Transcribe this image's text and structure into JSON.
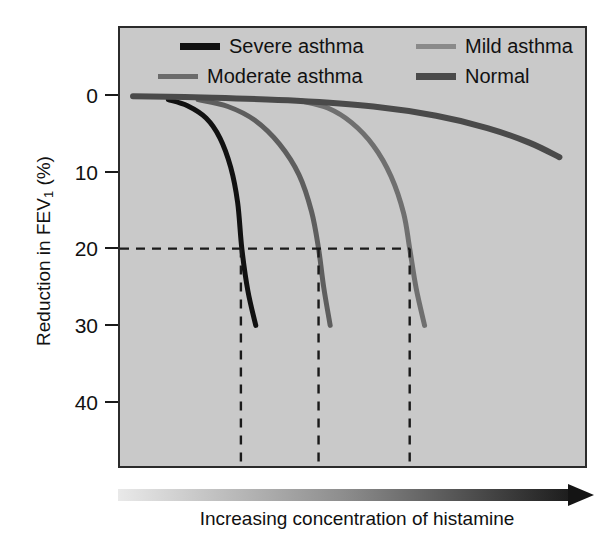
{
  "chart_data": {
    "type": "line",
    "title": "",
    "xlabel": "Increasing concentration of histamine",
    "ylabel": "Reduction in FEV1 (%)",
    "ylabel_main": "Reduction in FEV",
    "ylabel_sub": "1",
    "ylabel_unit": " (%)",
    "x_axis": {
      "label": "Increasing concentration of histamine",
      "type": "arrow-gradient",
      "direction": "increasing-right",
      "ticks": [],
      "tick_labels": []
    },
    "y_axis": {
      "label": "Reduction in FEV1 (%)",
      "ticks": [
        0,
        10,
        20,
        30,
        40
      ],
      "tick_labels": [
        "0",
        "10",
        "20",
        "30",
        "40"
      ],
      "ylim": [
        0,
        46
      ],
      "direction": "inverted-downward"
    },
    "grid": false,
    "legend_position": "top-inside",
    "series": [
      {
        "name": "Severe asthma",
        "color": "#111111",
        "width": 5,
        "pc20_x": 0.26,
        "points": [
          [
            0.104,
            0.6
          ],
          [
            0.145,
            1.4
          ],
          [
            0.185,
            3.0
          ],
          [
            0.215,
            5.6
          ],
          [
            0.238,
            9.4
          ],
          [
            0.253,
            14.0
          ],
          [
            0.262,
            20.0
          ],
          [
            0.275,
            25.5
          ],
          [
            0.292,
            30.0
          ]
        ],
        "end_reduction": 30
      },
      {
        "name": "Moderate asthma",
        "color": "#5e5e5e",
        "width": 5,
        "pc20_x": 0.427,
        "points": [
          [
            0.168,
            0.6
          ],
          [
            0.232,
            1.5
          ],
          [
            0.29,
            3.3
          ],
          [
            0.343,
            6.4
          ],
          [
            0.385,
            10.4
          ],
          [
            0.412,
            15.2
          ],
          [
            0.427,
            20.0
          ],
          [
            0.438,
            25.0
          ],
          [
            0.452,
            30.0
          ]
        ],
        "end_reduction": 30
      },
      {
        "name": "Mild asthma",
        "color": "#6f6f6f",
        "width": 5,
        "pc20_x": 0.623,
        "points": [
          [
            0.392,
            0.8
          ],
          [
            0.447,
            1.7
          ],
          [
            0.498,
            3.6
          ],
          [
            0.545,
            6.6
          ],
          [
            0.583,
            10.6
          ],
          [
            0.61,
            15.4
          ],
          [
            0.623,
            20.0
          ],
          [
            0.637,
            25.2
          ],
          [
            0.655,
            30.0
          ]
        ],
        "end_reduction": 30
      },
      {
        "name": "Normal",
        "color": "#4a4a4a",
        "width": 6,
        "pc20_x": null,
        "points": [
          [
            0.028,
            0.15
          ],
          [
            0.2,
            0.35
          ],
          [
            0.38,
            0.75
          ],
          [
            0.545,
            1.5
          ],
          [
            0.68,
            2.7
          ],
          [
            0.79,
            4.3
          ],
          [
            0.88,
            6.2
          ],
          [
            0.945,
            8.1
          ]
        ],
        "end_reduction": 8
      }
    ],
    "annotations": {
      "threshold_line": {
        "value": 20,
        "style": "dashed",
        "orientation": "horizontal",
        "label": ""
      },
      "drop_lines": {
        "style": "dashed",
        "orientation": "vertical",
        "series": [
          "Severe asthma",
          "Moderate asthma",
          "Mild asthma"
        ],
        "x_values": [
          0.26,
          0.427,
          0.623
        ]
      }
    }
  },
  "legend": {
    "entries": [
      {
        "label": "Severe asthma",
        "color": "#111111"
      },
      {
        "label": "Moderate asthma",
        "color": "#6b6b6b"
      },
      {
        "label": "Mild asthma",
        "color": "#8a8a8a"
      },
      {
        "label": "Normal",
        "color": "#4a4a4a"
      }
    ]
  },
  "colors": {
    "plot_background": "#c9c9c9",
    "page_background": "#ffffff",
    "frame": "#2b2b2b",
    "text": "#111111",
    "dashed": "#1a1a1a"
  }
}
